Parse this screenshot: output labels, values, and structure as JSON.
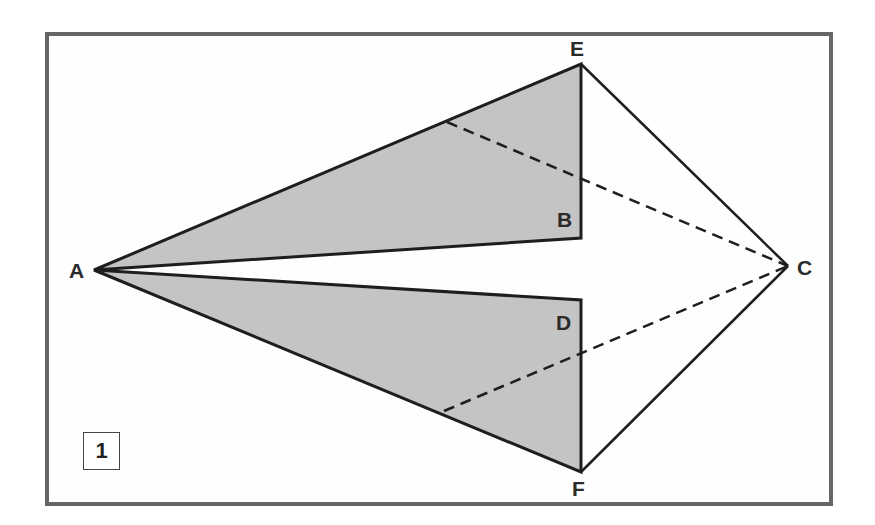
{
  "diagram": {
    "type": "geometric-fold-figure",
    "step_number": "1",
    "colors": {
      "frame_border": "#666666",
      "shaded_fill": "#c4c4c4",
      "line": "#1e1e1e",
      "background": "#ffffff"
    },
    "points": {
      "A": {
        "label": "A",
        "x": 94,
        "y": 270
      },
      "B": {
        "label": "B",
        "x": 581,
        "y": 238
      },
      "C": {
        "label": "C",
        "x": 788,
        "y": 266
      },
      "D": {
        "label": "D",
        "x": 581,
        "y": 300
      },
      "E": {
        "label": "E",
        "x": 581,
        "y": 64
      },
      "F": {
        "label": "F",
        "x": 581,
        "y": 472
      }
    },
    "shaded_regions": [
      {
        "name": "upper-triangle",
        "vertices": [
          "A",
          "E",
          "B"
        ]
      },
      {
        "name": "lower-triangle",
        "vertices": [
          "A",
          "D",
          "F"
        ]
      }
    ],
    "solid_segments": [
      [
        "A",
        "E"
      ],
      [
        "E",
        "B"
      ],
      [
        "B",
        "A"
      ],
      [
        "A",
        "D"
      ],
      [
        "D",
        "F"
      ],
      [
        "F",
        "A"
      ],
      [
        "E",
        "C"
      ],
      [
        "C",
        "F"
      ]
    ],
    "dashed_segments": [
      {
        "from": {
          "x": 447,
          "y": 122
        },
        "to": "C",
        "note": "from point on AE to C"
      },
      {
        "from": {
          "x": 444,
          "y": 411
        },
        "to": "C",
        "note": "from point on AF to C"
      }
    ]
  }
}
